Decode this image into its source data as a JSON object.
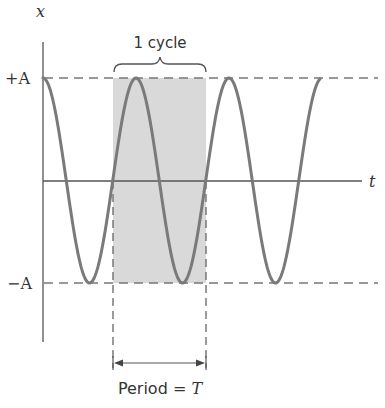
{
  "diagram": {
    "axes": {
      "y_label": "x",
      "x_label": "t"
    },
    "levels": {
      "plus_label": "+A",
      "minus_label": "−A"
    },
    "cycle_label": "1 cycle",
    "period_label_prefix": "Period = ",
    "period_symbol": "T",
    "colors": {
      "curve": "#7a7a7a",
      "axis": "#555555",
      "dash": "#777777",
      "shade": "#d8d8d8",
      "text": "#333333"
    }
  }
}
